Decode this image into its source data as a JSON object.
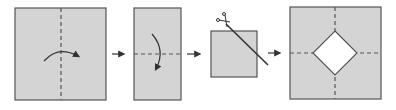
{
  "diagram": {
    "colors": {
      "paper_fill": "#d4d4d4",
      "stroke": "#555555",
      "dash": "#555555",
      "arrow": "#333333",
      "hole": "#ffffff"
    },
    "steps": [
      {
        "id": 1,
        "shape": "square",
        "fold_line": "vertical-dashed",
        "fold_arrow": "left-to-right"
      },
      {
        "id": 2,
        "shape": "tall-rectangle",
        "fold_line": "horizontal-dashed",
        "fold_arrow": "top-to-bottom"
      },
      {
        "id": 3,
        "shape": "small-square",
        "cut": "diagonal-corner-cut",
        "tool": "scissors-icon"
      },
      {
        "id": 4,
        "shape": "square-unfolded",
        "fold_lines": [
          "vertical-dashed",
          "horizontal-dashed"
        ],
        "hole": "diamond"
      }
    ],
    "transition_arrows": 3
  }
}
